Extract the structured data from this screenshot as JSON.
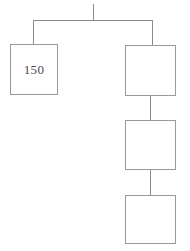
{
  "diagram": {
    "type": "tree",
    "title": "",
    "background_color": "#ffffff",
    "line_color": "#8c8c8c",
    "box_border_color": "#9a9a9a",
    "box_fill_color": "#ffffff",
    "text_color": "#4a4a4a",
    "nodes": [
      {
        "id": "node-left",
        "name": "node-150",
        "label": "150",
        "x": 10,
        "y": 44,
        "width": 48,
        "height": 51,
        "empty": false
      },
      {
        "id": "node-right-1",
        "name": "node-right-top",
        "label": "",
        "x": 125,
        "y": 45,
        "width": 51,
        "height": 51,
        "empty": true
      },
      {
        "id": "node-right-2",
        "name": "node-right-middle",
        "label": "",
        "x": 125,
        "y": 120,
        "width": 51,
        "height": 50,
        "empty": true
      },
      {
        "id": "node-right-3",
        "name": "node-right-bottom",
        "label": "",
        "x": 125,
        "y": 195,
        "width": 51,
        "height": 49,
        "empty": true
      }
    ],
    "connectors": [
      {
        "name": "root-stub",
        "x1": 93,
        "y1": 4,
        "x2": 93,
        "y2": 20
      },
      {
        "name": "horizontal-branch-bar",
        "x1": 33,
        "y1": 20,
        "x2": 152,
        "y2": 20
      },
      {
        "name": "branch-to-left-node",
        "x1": 33,
        "y1": 20,
        "x2": 33,
        "y2": 44
      },
      {
        "name": "branch-to-right-node",
        "x1": 152,
        "y1": 20,
        "x2": 152,
        "y2": 45
      },
      {
        "name": "link-right1-to-right2",
        "x1": 150,
        "y1": 96,
        "x2": 150,
        "y2": 120
      },
      {
        "name": "link-right2-to-right3",
        "x1": 150,
        "y1": 170,
        "x2": 150,
        "y2": 195
      }
    ]
  }
}
